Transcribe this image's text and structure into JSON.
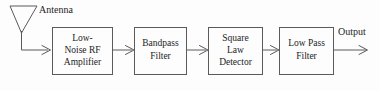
{
  "diagram": {
    "type": "block-diagram",
    "background_color": "#fdfdfd",
    "line_color": "#5a5a5a",
    "text_color": "#1c1c1c",
    "antenna": {
      "icon": "antenna-icon",
      "label": "Antenna"
    },
    "blocks": [
      {
        "id": "low-noise-rf-amplifier",
        "lines": [
          "Low-",
          "Noise RF",
          "Amplifier"
        ]
      },
      {
        "id": "bandpass-filter",
        "lines": [
          "Bandpass",
          "Filter"
        ]
      },
      {
        "id": "square-law-detector",
        "lines": [
          "Square",
          "Law",
          "Detector"
        ]
      },
      {
        "id": "low-pass-filter",
        "lines": [
          "Low Pass",
          "Filter"
        ]
      }
    ],
    "output": {
      "label": "Output"
    }
  }
}
